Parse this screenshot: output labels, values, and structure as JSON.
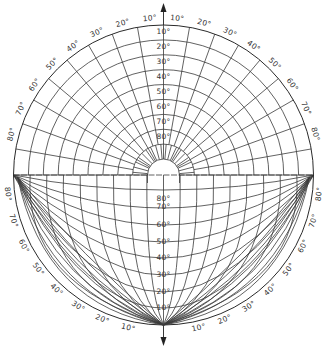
{
  "diagram": {
    "title": "Sky-view protractor diagram",
    "center": [
      163.5,
      175
    ],
    "radius": 150,
    "colors": {
      "line": "#3a3a3a",
      "text": "#333333",
      "background": "#ffffff"
    },
    "upper_half": {
      "center_labels": [
        "10°",
        "20°",
        "30°",
        "40°",
        "50°",
        "60°",
        "70°",
        "80°"
      ],
      "rim_labels_left": [
        "10°",
        "20°",
        "30°",
        "40°",
        "50°",
        "60°",
        "70°",
        "80°"
      ],
      "rim_labels_right": [
        "10°",
        "20°",
        "30°",
        "40°",
        "50°",
        "60°",
        "70°",
        "80°"
      ],
      "top_arrow": "north-arrow"
    },
    "lower_half": {
      "center_labels": [
        "80°",
        "70°",
        "60°",
        "50°",
        "40°",
        "30°",
        "20°",
        "10°"
      ],
      "rim_labels_left": [
        "80°",
        "70°",
        "60°",
        "50°",
        "40°",
        "30°",
        "20°",
        "10°"
      ],
      "rim_labels_right": [
        "80°",
        "70°",
        "60°",
        "50°",
        "40°",
        "30°",
        "20°",
        "10°"
      ],
      "bottom_arrow": "south-arrow"
    }
  },
  "chart_data": {
    "type": "polar-grid",
    "title": "",
    "upper_altitude_circles_deg": [
      10,
      20,
      30,
      40,
      50,
      60,
      70,
      80
    ],
    "upper_azimuth_lines_deg": [
      -80,
      -70,
      -60,
      -50,
      -40,
      -30,
      -20,
      -10,
      0,
      10,
      20,
      30,
      40,
      50,
      60,
      70,
      80
    ],
    "lower_altitude_arcs_deg": [
      80,
      70,
      60,
      50,
      40,
      30,
      20,
      10
    ],
    "lower_rim_arcs_deg": [
      80,
      70,
      60,
      50,
      40,
      30,
      20,
      10
    ]
  }
}
